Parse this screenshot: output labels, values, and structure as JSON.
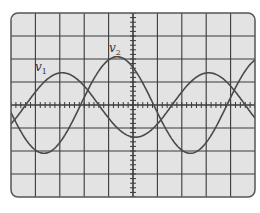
{
  "diagram": {
    "type": "oscilloscope-display",
    "grid": {
      "horizontal_divisions": 10,
      "vertical_divisions": 8,
      "minor_ticks_per_division": 5
    },
    "colors": {
      "screen": "#e3e3e3",
      "grid": "#3a3a3a",
      "trace": "#4a4a4a",
      "frame": "#555555"
    },
    "traces": [
      {
        "name": "v1",
        "label_main": "v",
        "label_sub": "1",
        "amplitude_div": 1.4,
        "period_div": 6,
        "zero_cross_up_div": -4.4
      },
      {
        "name": "v2",
        "label_main": "v",
        "label_sub": "2",
        "amplitude_div": 2.1,
        "period_div": 6,
        "zero_cross_up_div": -2.15
      }
    ]
  }
}
